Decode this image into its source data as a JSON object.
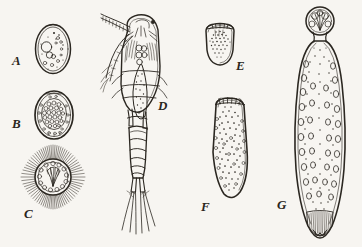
{
  "plate": {
    "title": "Plate of developmental stages",
    "background_color": "#f7f5f1",
    "ink_color": "#2b2721",
    "width": 362,
    "height": 247,
    "style": "pen-and-ink engraving"
  },
  "figures": [
    {
      "key": "A",
      "label": "A",
      "caption": "Oval cyst with few large vacuoles and scattered granules",
      "shape": "ovoid cell",
      "label_x": 12,
      "label_y": 61,
      "x": 28,
      "y": 18,
      "w": 46,
      "h": 58
    },
    {
      "key": "B",
      "label": "B",
      "caption": "Oval cyst densely packed with small round cells",
      "shape": "ovoid cell with morula",
      "label_x": 12,
      "label_y": 124,
      "x": 28,
      "y": 88,
      "w": 48,
      "h": 50
    },
    {
      "key": "C",
      "label": "C",
      "caption": "Radiate spiny stage with ring of cells and crown of spines",
      "shape": "sunburst radial",
      "label_x": 24,
      "label_y": 214,
      "x": 14,
      "y": 144,
      "w": 76,
      "h": 66
    },
    {
      "key": "D",
      "label": "D",
      "caption": "Copepod crustacean with antennae, segmented thorax and caudal setae",
      "shape": "copepod",
      "label_x": 159,
      "label_y": 106,
      "x": 104,
      "y": 14,
      "w": 62,
      "h": 218
    },
    {
      "key": "E",
      "label": "E",
      "caption": "Small rounded larva with apical crown and stippled interior",
      "shape": "ovoid larva",
      "label_x": 236,
      "label_y": 66,
      "x": 202,
      "y": 22,
      "w": 34,
      "h": 44
    },
    {
      "key": "F",
      "label": "F",
      "caption": "Elongated larva with apical crown of hooks and granular body",
      "shape": "elongate larva",
      "label_x": 201,
      "label_y": 207,
      "x": 206,
      "y": 96,
      "w": 44,
      "h": 104
    },
    {
      "key": "G",
      "label": "G",
      "caption": "Mature worm with rounded scolex, oval internal bodies and striated tail",
      "shape": "elongate worm",
      "label_x": 277,
      "label_y": 205,
      "x": 288,
      "y": 6,
      "w": 62,
      "h": 236
    }
  ]
}
